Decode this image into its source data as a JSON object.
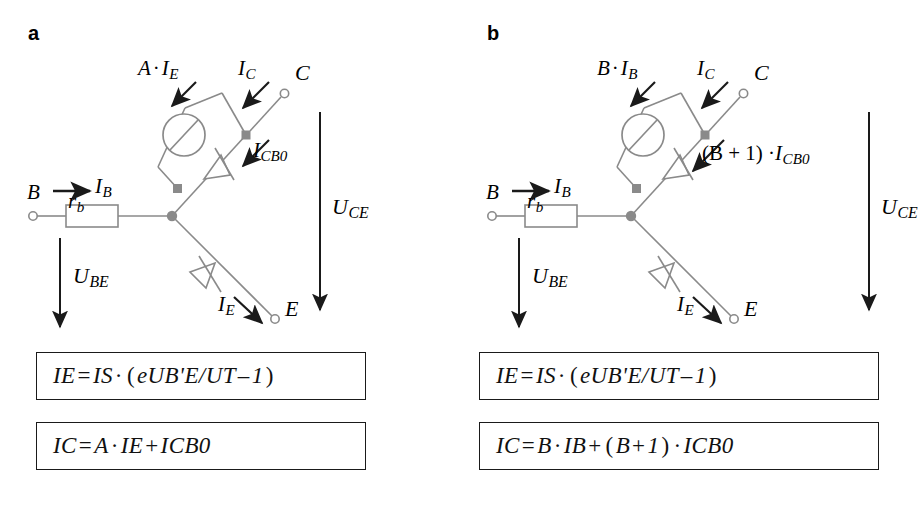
{
  "figure": {
    "type": "circuit-diagram",
    "width": 918,
    "height": 516,
    "line_color": "#8a8a8a",
    "node_color": "#8a8a8a",
    "arrow_color": "#1a1a1a",
    "text_color": "#111111",
    "background": "#ffffff"
  },
  "panels": [
    {
      "id": "a",
      "label": "a",
      "terminals": {
        "base": "B",
        "collector": "C",
        "emitter": "E"
      },
      "components": {
        "base_resistor": "r",
        "base_resistor_sub": "b",
        "current_source_label": "A · I",
        "current_source_sub": "E"
      },
      "currents": {
        "base_current": "I",
        "base_current_sub": "B",
        "source_current_main": "A",
        "source_current_mul": "·",
        "source_current_var": "I",
        "source_current_sub": "E",
        "collector_current": "I",
        "collector_current_sub": "C",
        "leakage_current": "I",
        "leakage_current_sub": "CB0",
        "emitter_current": "I",
        "emitter_current_sub": "E"
      },
      "voltages": {
        "base_emitter": "U",
        "base_emitter_sub": "BE",
        "collector_emitter": "U",
        "collector_emitter_sub": "CE"
      },
      "formulas": [
        {
          "lhs": "I",
          "lhs_sub": "E",
          "eq": "=",
          "rhs_1": "I",
          "rhs_1_sub": "S",
          "dot": "·",
          "open": "(",
          "exp_base": "e",
          "exp_num": "U",
          "exp_num_sub": "B'E",
          "slash": "/",
          "exp_den": "U",
          "exp_den_sub": "T",
          "minus": "–",
          "one": "1",
          "close": ")"
        },
        {
          "lhs": "I",
          "lhs_sub": "C",
          "eq": "=",
          "term1": "A",
          "dot": "·",
          "term2": "I",
          "term2_sub": "E",
          "plus": "+",
          "term3": "I",
          "term3_sub": "CB0"
        }
      ]
    },
    {
      "id": "b",
      "label": "b",
      "terminals": {
        "base": "B",
        "collector": "C",
        "emitter": "E"
      },
      "components": {
        "base_resistor": "r",
        "base_resistor_sub": "b",
        "current_source_label": "B · I",
        "current_source_sub": "B"
      },
      "currents": {
        "base_current": "I",
        "base_current_sub": "B",
        "source_current_main": "B",
        "source_current_mul": "·",
        "source_current_var": "I",
        "source_current_sub": "B",
        "collector_current": "I",
        "collector_current_sub": "C",
        "leakage_current_pre": "(B + 1) ·",
        "leakage_current": "I",
        "leakage_current_sub": "CB0",
        "emitter_current": "I",
        "emitter_current_sub": "E"
      },
      "voltages": {
        "base_emitter": "U",
        "base_emitter_sub": "BE",
        "collector_emitter": "U",
        "collector_emitter_sub": "CE"
      },
      "formulas": [
        {
          "lhs": "I",
          "lhs_sub": "E",
          "eq": "=",
          "rhs_1": "I",
          "rhs_1_sub": "S",
          "dot": "·",
          "open": "(",
          "exp_base": "e",
          "exp_num": "U",
          "exp_num_sub": "B'E",
          "slash": "/",
          "exp_den": "U",
          "exp_den_sub": "T",
          "minus": "–",
          "one": "1",
          "close": ")"
        },
        {
          "lhs": "I",
          "lhs_sub": "C",
          "eq": "=",
          "term1": "B",
          "dot": "·",
          "term2": "I",
          "term2_sub": "B",
          "plus": "+",
          "paren_open": "(",
          "beta": "B",
          "plus2": "+",
          "one": "1",
          "paren_close": ")",
          "dot2": "·",
          "term3": "I",
          "term3_sub": "CB0"
        }
      ]
    }
  ]
}
